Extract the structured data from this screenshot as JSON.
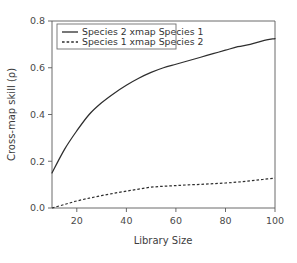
{
  "chart_data": {
    "type": "line",
    "title": "",
    "xlabel": "Library Size",
    "ylabel": "Cross-map skill (ρ)",
    "xlim": [
      10,
      100
    ],
    "ylim": [
      0.0,
      0.8
    ],
    "grid": false,
    "legend_position": "top-left",
    "x_ticks": [
      20,
      40,
      60,
      80,
      100
    ],
    "x_tick_labels": [
      "20",
      "40",
      "60",
      "80",
      "100"
    ],
    "y_ticks": [
      0.0,
      0.2,
      0.4,
      0.6,
      0.8
    ],
    "y_tick_labels": [
      "0.0",
      "0.2",
      "0.4",
      "0.6",
      "0.8"
    ],
    "x": [
      10,
      15,
      20,
      25,
      30,
      35,
      40,
      45,
      50,
      55,
      60,
      65,
      70,
      75,
      80,
      85,
      90,
      95,
      100
    ],
    "series": [
      {
        "name": "Species 2 xmap Species 1",
        "style": "solid",
        "color": "#2e2e2e",
        "values": [
          0.15,
          0.25,
          0.33,
          0.4,
          0.45,
          0.49,
          0.525,
          0.555,
          0.58,
          0.6,
          0.615,
          0.63,
          0.645,
          0.66,
          0.675,
          0.69,
          0.7,
          0.715,
          0.725
        ]
      },
      {
        "name": "Species 1 xmap Species 2",
        "style": "dashed",
        "color": "#2e2e2e",
        "values": [
          0.0,
          0.015,
          0.03,
          0.042,
          0.053,
          0.063,
          0.072,
          0.081,
          0.089,
          0.093,
          0.096,
          0.099,
          0.101,
          0.104,
          0.107,
          0.111,
          0.116,
          0.122,
          0.128
        ]
      }
    ]
  },
  "legend": {
    "entries": [
      {
        "label": "Species 2 xmap Species 1",
        "style": "solid"
      },
      {
        "label": "Species 1 xmap Species 2",
        "style": "dashed"
      }
    ]
  },
  "axes": {
    "x_label": "Library Size",
    "y_label": "Cross-map skill (ρ)",
    "x_tick_labels": [
      "20",
      "40",
      "60",
      "80",
      "100"
    ],
    "y_tick_labels": [
      "0.0",
      "0.2",
      "0.4",
      "0.6",
      "0.8"
    ]
  },
  "colors": {
    "background": "#ffffff",
    "axis": "#5a5a5a",
    "series": "#2e2e2e",
    "text": "#3a3a3a"
  }
}
